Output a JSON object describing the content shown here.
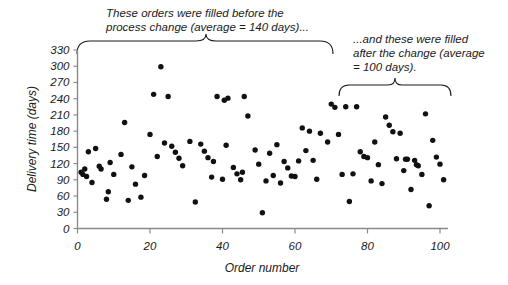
{
  "chart_data": {
    "type": "scatter",
    "title": "",
    "xlabel": "Order number",
    "ylabel": "Delivery time (days)",
    "xlim": [
      0,
      104
    ],
    "ylim": [
      0,
      330
    ],
    "xticks": [
      0,
      20,
      40,
      60,
      80,
      100
    ],
    "yticks": [
      0,
      30,
      60,
      90,
      120,
      150,
      180,
      210,
      240,
      270,
      300,
      330
    ],
    "grid": false,
    "legend": null,
    "series": [
      {
        "name": "Delivery time",
        "marker": "filled-circle",
        "color": "#111111",
        "points": [
          [
            1,
            104
          ],
          [
            1.5,
            100
          ],
          [
            2,
            110
          ],
          [
            2.5,
            96
          ],
          [
            3,
            142
          ],
          [
            4,
            85
          ],
          [
            5,
            148
          ],
          [
            6,
            115
          ],
          [
            6.5,
            110
          ],
          [
            8,
            54
          ],
          [
            8.5,
            68
          ],
          [
            9,
            122
          ],
          [
            10,
            100
          ],
          [
            12,
            137
          ],
          [
            13,
            196
          ],
          [
            14,
            52
          ],
          [
            15,
            114
          ],
          [
            16,
            82
          ],
          [
            17.5,
            58
          ],
          [
            18.5,
            98
          ],
          [
            20,
            174
          ],
          [
            21,
            248
          ],
          [
            22,
            133
          ],
          [
            23,
            299
          ],
          [
            24,
            158
          ],
          [
            25,
            244
          ],
          [
            26,
            152
          ],
          [
            27,
            141
          ],
          [
            28,
            130
          ],
          [
            29,
            116
          ],
          [
            31,
            161
          ],
          [
            32.5,
            49
          ],
          [
            34,
            156
          ],
          [
            35,
            143
          ],
          [
            36,
            131
          ],
          [
            37,
            95
          ],
          [
            37.5,
            124
          ],
          [
            38.5,
            244
          ],
          [
            40,
            91
          ],
          [
            40.5,
            237
          ],
          [
            41,
            154
          ],
          [
            41.5,
            241
          ],
          [
            43,
            113
          ],
          [
            44,
            101
          ],
          [
            45,
            90
          ],
          [
            45.5,
            104
          ],
          [
            46,
            244
          ],
          [
            47,
            208
          ],
          [
            49,
            145
          ],
          [
            50,
            119
          ],
          [
            51,
            29
          ],
          [
            52,
            88
          ],
          [
            53,
            139
          ],
          [
            54,
            98
          ],
          [
            55,
            155
          ],
          [
            56,
            84
          ],
          [
            57,
            124
          ],
          [
            58,
            112
          ],
          [
            59,
            97
          ],
          [
            60,
            96
          ],
          [
            61,
            125
          ],
          [
            62,
            186
          ],
          [
            63,
            144
          ],
          [
            64,
            180
          ],
          [
            65,
            126
          ],
          [
            66,
            91
          ],
          [
            67,
            176
          ],
          [
            69,
            160
          ],
          [
            70,
            230
          ],
          [
            71,
            224
          ],
          [
            72,
            174
          ],
          [
            73,
            100
          ],
          [
            74,
            225
          ],
          [
            75,
            50
          ],
          [
            76,
            101
          ],
          [
            77,
            225
          ],
          [
            78,
            142
          ],
          [
            79,
            133
          ],
          [
            80,
            131
          ],
          [
            81,
            88
          ],
          [
            82,
            160
          ],
          [
            83,
            118
          ],
          [
            84,
            83
          ],
          [
            85,
            206
          ],
          [
            86,
            191
          ],
          [
            87,
            179
          ],
          [
            88,
            129
          ],
          [
            89,
            176
          ],
          [
            90,
            107
          ],
          [
            90.5,
            128
          ],
          [
            91,
            128
          ],
          [
            92,
            72
          ],
          [
            93,
            126
          ],
          [
            93.5,
            118
          ],
          [
            94,
            116
          ],
          [
            95,
            100
          ],
          [
            96,
            212
          ],
          [
            97,
            42
          ],
          [
            98,
            163
          ],
          [
            99,
            132
          ],
          [
            100,
            119
          ],
          [
            101,
            90
          ]
        ]
      }
    ],
    "annotations": [
      {
        "id": "before-change",
        "text": "These orders were filled before the\nprocess change (average = 140 days)...",
        "brace": {
          "x_start": 1,
          "x_end": 72,
          "direction": "up"
        },
        "average": 140
      },
      {
        "id": "after-change",
        "text": "...and these were filled\nafter the change (average\n= 100 days).",
        "brace": {
          "x_start": 73,
          "x_end": 103,
          "direction": "up"
        },
        "average": 100
      }
    ]
  },
  "axis": {
    "x_title": "Order number",
    "y_title": "Delivery time (days)",
    "x_tick_labels": [
      "0",
      "20",
      "40",
      "60",
      "80",
      "100"
    ],
    "y_tick_labels": [
      "0",
      "30",
      "60",
      "90",
      "120",
      "150",
      "180",
      "210",
      "240",
      "270",
      "300",
      "330"
    ]
  },
  "annotations": {
    "before": "These orders were filled before the\nprocess change (average = 140 days)...",
    "after": "...and these were filled\nafter the change (average\n= 100 days)."
  },
  "colors": {
    "point": "#111111",
    "axis": "#8a8a8a",
    "text": "#1a1a1a",
    "background": "#ffffff"
  }
}
